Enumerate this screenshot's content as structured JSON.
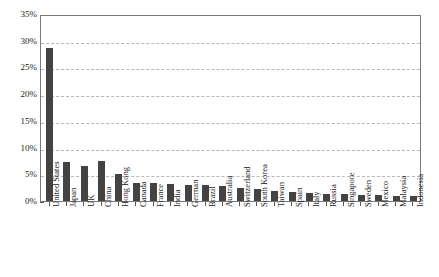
{
  "chart_data": {
    "type": "bar",
    "title": "",
    "subtitle": "",
    "xlabel": "",
    "ylabel": "",
    "ylim": [
      0,
      35
    ],
    "ytick_labels": [
      "0%",
      "5%",
      "10%",
      "15%",
      "20%",
      "25%",
      "30%",
      "35%"
    ],
    "ytick_values": [
      0,
      5,
      10,
      15,
      20,
      25,
      30,
      35
    ],
    "grid": "horizontal-dashed",
    "legend": "none",
    "bar_color": "#434343",
    "categories": [
      "United States",
      "Japan",
      "UK",
      "China",
      "Hong Kong",
      "Canada",
      "France",
      "India",
      "German",
      "Brazil",
      "Australia",
      "Switzerland",
      "South Korea",
      "Taiwan",
      "Spain",
      "Italy",
      "Russia",
      "Singapore",
      "Sweden",
      "Mexico",
      "Malaysia",
      "Indonesia"
    ],
    "values": [
      28.7,
      7.3,
      6.6,
      7.4,
      5.0,
      3.4,
      3.3,
      3.2,
      3.0,
      3.0,
      2.9,
      2.4,
      2.3,
      1.8,
      1.6,
      1.5,
      1.4,
      1.3,
      1.2,
      1.1,
      1.0,
      0.9
    ]
  }
}
